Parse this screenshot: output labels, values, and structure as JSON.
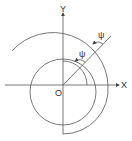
{
  "labels": {
    "y_axis": "Y",
    "x_axis": "X",
    "origin": "O",
    "angle_inner": "ψ",
    "angle_outer": "ψ"
  },
  "colors": {
    "stroke": "#555555"
  }
}
